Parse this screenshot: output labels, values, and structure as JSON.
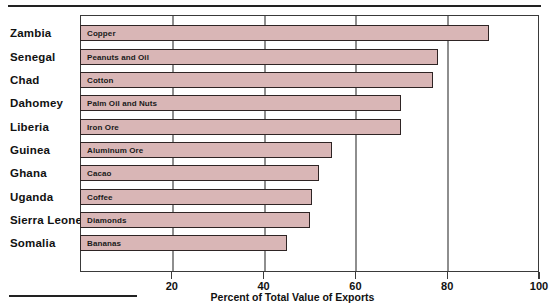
{
  "chart_data": {
    "type": "bar",
    "orientation": "horizontal",
    "title": "",
    "xlabel": "Percent of Total Value of Exports",
    "ylabel": "",
    "xlim": [
      0,
      100
    ],
    "xticks": [
      20,
      40,
      60,
      80,
      100
    ],
    "grid": true,
    "legend": "none",
    "bar_color": "#d9b6b6",
    "bar_border_color": "#2e2424",
    "gridline_color": "#8e8e8e",
    "categories": [
      "Zambia",
      "Senegal",
      "Chad",
      "Dahomey",
      "Liberia",
      "Guinea",
      "Ghana",
      "Uganda",
      "Sierra Leone",
      "Somalia"
    ],
    "values": [
      89,
      78,
      77,
      70,
      70,
      55,
      52,
      50.5,
      50,
      45
    ],
    "point_labels": [
      "Copper",
      "Peanuts and Oil",
      "Cotton",
      "Palm Oil and Nuts",
      "Iron Ore",
      "Aluminum Ore",
      "Cacao",
      "Coffee",
      "Diamonds",
      "Bananas"
    ]
  },
  "axis": {
    "tick_labels": [
      "20",
      "40",
      "60",
      "80",
      "100"
    ],
    "x_title": "Percent of Total Value of Exports"
  }
}
